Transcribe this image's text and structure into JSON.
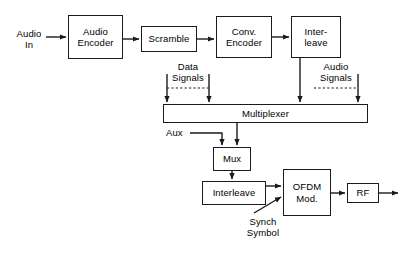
{
  "diagram": {
    "stroke_color": "#1a1a1a",
    "background_color": "#ffffff",
    "blocks": [
      {
        "id": "audio_encoder",
        "label": "Audio\nEncoder",
        "x": 68,
        "y": 15,
        "w": 55,
        "h": 44
      },
      {
        "id": "scramble",
        "label": "Scramble",
        "x": 141,
        "y": 26,
        "w": 56,
        "h": 26
      },
      {
        "id": "conv_encoder",
        "label": "Conv.\nEncoder",
        "x": 216,
        "y": 16,
        "w": 56,
        "h": 42
      },
      {
        "id": "interleave_top",
        "label": "Inter-\nleave",
        "x": 291,
        "y": 16,
        "w": 50,
        "h": 42
      },
      {
        "id": "multiplexer",
        "label": "Multiplexer",
        "x": 163,
        "y": 104,
        "w": 205,
        "h": 19
      },
      {
        "id": "mux",
        "label": "Mux",
        "x": 213,
        "y": 147,
        "w": 38,
        "h": 24
      },
      {
        "id": "interleave_bot",
        "label": "Interleave",
        "x": 202,
        "y": 181,
        "w": 64,
        "h": 24
      },
      {
        "id": "ofdm_mod",
        "label": "OFDM\nMod.",
        "x": 283,
        "y": 169,
        "w": 48,
        "h": 47
      },
      {
        "id": "rf",
        "label": "RF",
        "x": 347,
        "y": 183,
        "w": 32,
        "h": 20
      }
    ],
    "labels": [
      {
        "id": "audio_in",
        "text": "Audio\nIn",
        "x": 12,
        "y": 28
      },
      {
        "id": "data_signals",
        "text": "Data\nSignals",
        "x": 170,
        "y": 62
      },
      {
        "id": "audio_signals",
        "text": "Audio\nSignals",
        "x": 317,
        "y": 62
      },
      {
        "id": "aux",
        "text": "Aux",
        "x": 166,
        "y": 128
      },
      {
        "id": "synch_symbol",
        "text": "Synch\nSymbol",
        "x": 249,
        "y": 216
      }
    ]
  }
}
